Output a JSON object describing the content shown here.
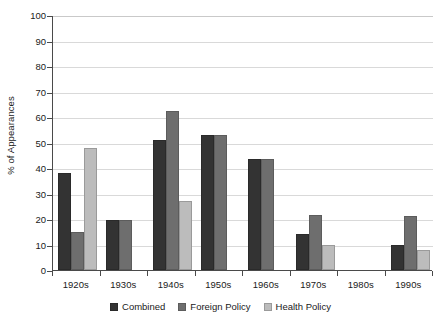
{
  "chart_data": {
    "type": "bar",
    "title": "",
    "xlabel": "",
    "ylabel": "% of Appearances",
    "ylim": [
      0,
      100
    ],
    "ytick_step": 10,
    "yticks": [
      "100",
      "90",
      "80",
      "70",
      "60",
      "50",
      "40",
      "30",
      "20",
      "10",
      "0"
    ],
    "grid": true,
    "legend_position": "bottom",
    "categories": [
      "1920s",
      "1930s",
      "1940s",
      "1950s",
      "1960s",
      "1970s",
      "1980s",
      "1990s"
    ],
    "series": [
      {
        "name": "Combined",
        "key": "combined",
        "color": "#333333",
        "values": [
          38,
          19.5,
          51,
          53,
          43.5,
          14,
          null,
          10
        ]
      },
      {
        "name": "Foreign Policy",
        "key": "foreign",
        "color": "#6e6e6e",
        "values": [
          15,
          19.5,
          62.5,
          53,
          43.5,
          21.5,
          null,
          21
        ]
      },
      {
        "name": "Health Policy",
        "key": "health",
        "color": "#bcbcbc",
        "values": [
          48,
          null,
          27,
          null,
          null,
          10,
          null,
          8
        ]
      }
    ]
  },
  "legend": {
    "items": [
      {
        "label": "Combined",
        "key": "combined"
      },
      {
        "label": "Foreign Policy",
        "key": "foreign"
      },
      {
        "label": "Health Policy",
        "key": "health"
      }
    ]
  }
}
